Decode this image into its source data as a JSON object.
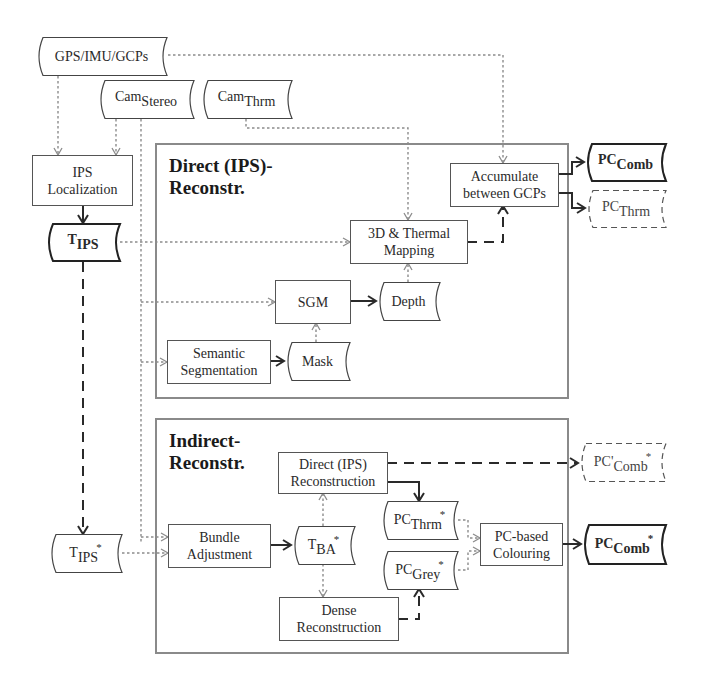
{
  "diagram": {
    "groups": {
      "direct": {
        "title_line1": "Direct (IPS)-",
        "title_line2": "Reconstr."
      },
      "indirect": {
        "title_line1": "Indirect-",
        "title_line2": "Reconstr."
      }
    },
    "inputs": {
      "gps": {
        "label": "GPS/IMU/GCPs"
      },
      "cam_stereo": {
        "base": "Cam",
        "sub": "Stereo"
      },
      "cam_thrm": {
        "base": "Cam",
        "sub": "Thrm"
      }
    },
    "processes": {
      "ips_localization": {
        "line1": "IPS",
        "line2": "Localization"
      },
      "accumulate": {
        "line1": "Accumulate",
        "line2": "between GCPs"
      },
      "thermal_mapping": {
        "line1": "3D & Thermal",
        "line2": "Mapping"
      },
      "sgm": {
        "label": "SGM"
      },
      "semantic_segmentation": {
        "line1": "Semantic",
        "line2": "Segmentation"
      },
      "direct_reconstruction": {
        "line1": "Direct (IPS)",
        "line2": "Reconstruction"
      },
      "bundle_adjustment": {
        "line1": "Bundle",
        "line2": "Adjustment"
      },
      "dense_reconstruction": {
        "line1": "Dense",
        "line2": "Reconstruction"
      },
      "pc_colouring": {
        "line1": "PC-based",
        "line2": "Colouring"
      }
    },
    "data_items": {
      "t_ips": {
        "base": "T",
        "sub": "IPS",
        "sup": ""
      },
      "t_ips_star": {
        "base": "T",
        "sub": "IPS",
        "sup": "*"
      },
      "depth": {
        "label": "Depth"
      },
      "mask": {
        "label": "Mask"
      },
      "pc_comb": {
        "base": "PC",
        "sub": "Comb",
        "sup": ""
      },
      "pc_thrm": {
        "base": "PC",
        "sub": "Thrm",
        "sup": ""
      },
      "pc_comb_prime_star": {
        "base": "PC'",
        "sub": "Comb",
        "sup": "*"
      },
      "pc_thrm_star": {
        "base": "PC",
        "sub": "Thrm",
        "sup": "*"
      },
      "pc_grey_star": {
        "base": "PC",
        "sub": "Grey",
        "sup": "*"
      },
      "pc_comb_star": {
        "base": "PC",
        "sub": "Comb",
        "sup": "*"
      },
      "t_ba_star": {
        "base": "T",
        "sub": "BA",
        "sup": "*"
      }
    },
    "colors": {
      "solid_line": "#2a2a2a",
      "dotted_line": "#8c8c8c",
      "group_border": "#8a8a8a",
      "box_border": "#555555"
    }
  }
}
